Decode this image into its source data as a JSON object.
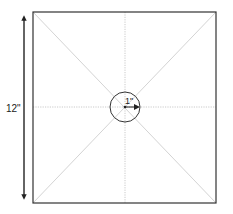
{
  "diagram": {
    "type": "square-template-with-center-circle",
    "square": {
      "side_label": "12\""
    },
    "circle": {
      "radius_label": "1\""
    },
    "guides": [
      "diagonal-1",
      "diagonal-2",
      "vertical-center",
      "horizontal-center"
    ],
    "colors": {
      "outline": "#333333",
      "guide": "#bdbdbd",
      "text": "#222222"
    }
  }
}
